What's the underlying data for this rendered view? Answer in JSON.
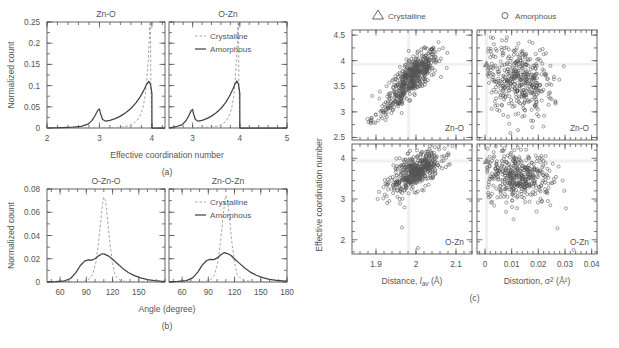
{
  "figure": {
    "panel_labels": {
      "a": "(a)",
      "b": "(b)",
      "c": "(c)"
    },
    "caption": ""
  },
  "panel_a": {
    "ylabel": "Normalized count",
    "xlabel": "Effective coordination number",
    "subplots": [
      {
        "title": "Zn-O",
        "xticks": [
          "2",
          "3",
          "4"
        ],
        "xlim": [
          2,
          4.25
        ]
      },
      {
        "title": "O-Zn",
        "xticks": [
          "3",
          "4",
          "5"
        ],
        "xlim": [
          2.5,
          5
        ]
      }
    ],
    "yticks": [
      "0",
      "0.05",
      "0.1",
      "0.15",
      "0.2",
      "0.25"
    ],
    "ylim": [
      0,
      0.25
    ],
    "legend": [
      {
        "label": "Crystalline",
        "style": "dashed",
        "color": "#9a9a9a"
      },
      {
        "label": "Amorphous",
        "style": "solid",
        "color": "#444444"
      }
    ]
  },
  "panel_b": {
    "ylabel": "Normalized count",
    "xlabel": "Angle (degree)",
    "subplots": [
      {
        "title": "O-Zn-O",
        "xticks": [
          "60",
          "90",
          "120",
          "150"
        ],
        "xlim": [
          45,
          180
        ]
      },
      {
        "title": "Zn-O-Zn",
        "xticks": [
          "60",
          "90",
          "120",
          "150",
          "180"
        ],
        "xlim": [
          45,
          180
        ]
      }
    ],
    "yticks": [
      "0",
      "0.02",
      "0.04",
      "0.06",
      "0.08"
    ],
    "ylim": [
      0,
      0.08
    ],
    "legend": [
      {
        "label": "Crystalline",
        "style": "dashed",
        "color": "#9a9a9a"
      },
      {
        "label": "Amorphous",
        "style": "solid",
        "color": "#444444"
      }
    ]
  },
  "panel_c": {
    "ylabel": "Effective coordination number",
    "legend": [
      {
        "label": "Crystalline",
        "marker": "triangle"
      },
      {
        "label": "Amorphous",
        "marker": "circle"
      }
    ],
    "columns": [
      {
        "xlabel_main": "Distance, ",
        "xlabel_var": "l",
        "xlabel_sub": "av",
        "xlabel_unit": " (Å)",
        "xticks": [
          "1.9",
          "2",
          "2.1"
        ],
        "xlim": [
          1.84,
          2.14
        ]
      },
      {
        "xlabel_main": "Distortion, ",
        "xlabel_var": "σ",
        "xlabel_sup": "2",
        "xlabel_unit": " (Å²)",
        "xticks": [
          "0",
          "0.01",
          "0.02",
          "0.03",
          "0.04"
        ],
        "xlim": [
          -0.003,
          0.042
        ]
      }
    ],
    "rows": [
      {
        "panel_tag": "Zn-O",
        "yticks": [
          "2.5",
          "3",
          "3.5",
          "4",
          "4.5"
        ],
        "ylim": [
          2.45,
          4.6
        ]
      },
      {
        "panel_tag": "O-Zn",
        "yticks": [
          "2",
          "3",
          "4"
        ],
        "ylim": [
          1.65,
          4.35
        ]
      }
    ]
  },
  "chart_data": [
    {
      "type": "line",
      "id": "a-left",
      "title": "Zn-O",
      "xlabel": "Effective coordination number",
      "ylabel": "Normalized count",
      "xlim": [
        2,
        4.25
      ],
      "ylim": [
        0,
        0.25
      ],
      "grid": false,
      "legend_position": "upper-right-shared",
      "series": [
        {
          "name": "Amorphous",
          "style": "solid",
          "x": [
            2.0,
            2.3,
            2.5,
            2.65,
            2.78,
            2.86,
            2.92,
            2.97,
            3.0,
            3.02,
            3.06,
            3.12,
            3.2,
            3.3,
            3.4,
            3.5,
            3.6,
            3.7,
            3.78,
            3.85,
            3.9,
            3.94,
            3.97,
            3.99,
            4.0,
            4.001,
            4.1,
            4.25
          ],
          "y": [
            0.0,
            0.001,
            0.002,
            0.004,
            0.009,
            0.018,
            0.03,
            0.042,
            0.045,
            0.034,
            0.02,
            0.016,
            0.018,
            0.022,
            0.028,
            0.036,
            0.046,
            0.06,
            0.074,
            0.09,
            0.103,
            0.11,
            0.104,
            0.09,
            0.082,
            0.0,
            0.0,
            0.0
          ]
        },
        {
          "name": "Crystalline",
          "style": "dashed",
          "x": [
            2.0,
            3.0,
            3.4,
            3.55,
            3.65,
            3.72,
            3.78,
            3.83,
            3.87,
            3.9,
            3.93,
            3.95,
            3.96,
            3.97,
            3.975,
            3.98,
            4.0,
            4.25
          ],
          "y": [
            0.0,
            0.0,
            0.002,
            0.005,
            0.01,
            0.018,
            0.03,
            0.048,
            0.074,
            0.11,
            0.16,
            0.21,
            0.25,
            0.25,
            0.2,
            0.11,
            0.0,
            0.0
          ]
        }
      ]
    },
    {
      "type": "line",
      "id": "a-right",
      "title": "O-Zn",
      "xlabel": "Effective coordination number",
      "ylabel": "Normalized count",
      "xlim": [
        2.5,
        5
      ],
      "ylim": [
        0,
        0.25
      ],
      "grid": false,
      "series": [
        {
          "name": "Amorphous",
          "style": "solid",
          "x": [
            2.5,
            2.65,
            2.78,
            2.86,
            2.92,
            2.97,
            3.0,
            3.02,
            3.06,
            3.12,
            3.2,
            3.3,
            3.4,
            3.5,
            3.6,
            3.7,
            3.78,
            3.85,
            3.9,
            3.94,
            3.97,
            3.99,
            4.0,
            4.001,
            4.3,
            5.0
          ],
          "y": [
            0.0,
            0.003,
            0.008,
            0.017,
            0.029,
            0.041,
            0.044,
            0.033,
            0.02,
            0.016,
            0.018,
            0.022,
            0.028,
            0.036,
            0.046,
            0.06,
            0.075,
            0.091,
            0.104,
            0.111,
            0.104,
            0.09,
            0.082,
            0.0,
            0.0,
            0.0
          ]
        },
        {
          "name": "Crystalline",
          "style": "dashed",
          "x": [
            2.5,
            3.0,
            3.4,
            3.55,
            3.65,
            3.72,
            3.78,
            3.83,
            3.87,
            3.9,
            3.93,
            3.95,
            3.96,
            3.97,
            3.975,
            3.98,
            4.0,
            5.0
          ],
          "y": [
            0.0,
            0.0,
            0.002,
            0.005,
            0.01,
            0.018,
            0.03,
            0.048,
            0.074,
            0.11,
            0.16,
            0.21,
            0.25,
            0.25,
            0.2,
            0.11,
            0.0,
            0.0
          ]
        }
      ]
    },
    {
      "type": "line",
      "id": "b-left",
      "title": "O-Zn-O",
      "xlabel": "Angle (degree)",
      "ylabel": "Normalized count",
      "xlim": [
        45,
        180
      ],
      "ylim": [
        0,
        0.08
      ],
      "grid": false,
      "series": [
        {
          "name": "Amorphous",
          "style": "solid",
          "x": [
            45,
            55,
            65,
            72,
            78,
            83,
            88,
            92,
            96,
            100,
            104,
            108,
            111,
            115,
            120,
            126,
            132,
            138,
            145,
            152,
            160,
            168,
            175,
            180
          ],
          "y": [
            0.0002,
            0.0004,
            0.001,
            0.003,
            0.008,
            0.014,
            0.018,
            0.019,
            0.0188,
            0.02,
            0.0225,
            0.0243,
            0.024,
            0.0225,
            0.0195,
            0.0155,
            0.0115,
            0.0082,
            0.0055,
            0.0035,
            0.002,
            0.0012,
            0.0008,
            0.0006
          ]
        },
        {
          "name": "Crystalline",
          "style": "dashed",
          "x": [
            45,
            85,
            92,
            97,
            101,
            104,
            107,
            109,
            110,
            112,
            114,
            117,
            120,
            123,
            126,
            130,
            140,
            180
          ],
          "y": [
            0.0,
            0.0002,
            0.0015,
            0.006,
            0.017,
            0.034,
            0.056,
            0.07,
            0.073,
            0.07,
            0.056,
            0.033,
            0.016,
            0.006,
            0.003,
            0.001,
            0.0002,
            0.0
          ]
        }
      ]
    },
    {
      "type": "line",
      "id": "b-right",
      "title": "Zn-O-Zn",
      "xlabel": "Angle (degree)",
      "ylabel": "Normalized count",
      "xlim": [
        45,
        180
      ],
      "ylim": [
        0,
        0.08
      ],
      "grid": false,
      "series": [
        {
          "name": "Amorphous",
          "style": "solid",
          "x": [
            45,
            55,
            65,
            72,
            78,
            83,
            88,
            92,
            96,
            100,
            104,
            108,
            112,
            116,
            120,
            126,
            132,
            138,
            145,
            152,
            160,
            168,
            175,
            180
          ],
          "y": [
            0.0002,
            0.0005,
            0.0012,
            0.0035,
            0.0085,
            0.0145,
            0.0185,
            0.0195,
            0.0192,
            0.0205,
            0.0232,
            0.0252,
            0.0245,
            0.0228,
            0.0198,
            0.0158,
            0.0118,
            0.0085,
            0.0058,
            0.0037,
            0.0022,
            0.0013,
            0.0009,
            0.0007
          ]
        },
        {
          "name": "Crystalline",
          "style": "dashed",
          "x": [
            45,
            85,
            92,
            97,
            101,
            104,
            107,
            109,
            110,
            112,
            114,
            117,
            120,
            123,
            127,
            132,
            142,
            180
          ],
          "y": [
            0.0,
            0.0002,
            0.0015,
            0.006,
            0.0175,
            0.035,
            0.057,
            0.071,
            0.0745,
            0.0705,
            0.0565,
            0.0335,
            0.0165,
            0.0065,
            0.0032,
            0.0012,
            0.0003,
            0.0
          ]
        }
      ]
    },
    {
      "type": "scatter",
      "id": "c-top-left",
      "panel_tag": "Zn-O",
      "xlabel": "Distance, l_av (Å)",
      "ylabel": "Effective coordination number",
      "xlim": [
        1.84,
        2.14
      ],
      "ylim": [
        2.45,
        4.6
      ],
      "series": [
        {
          "name": "Crystalline",
          "marker": "triangle",
          "x": [
            1.982
          ],
          "y": [
            3.93
          ]
        },
        {
          "name": "Amorphous",
          "marker": "circle",
          "n_points": 520,
          "cluster": {
            "x_center": 1.995,
            "y_center": 3.72,
            "x_spread": 0.03,
            "y_spread": 0.24,
            "correlation": 0.72
          },
          "tail": {
            "x_range": [
              1.885,
              1.965
            ],
            "y_range": [
              2.78,
              3.3
            ]
          }
        }
      ]
    },
    {
      "type": "scatter",
      "id": "c-top-right",
      "panel_tag": "Zn-O",
      "xlabel": "Distortion, σ² (Å²)",
      "ylabel": "Effective coordination number",
      "xlim": [
        -0.003,
        0.042
      ],
      "ylim": [
        2.45,
        4.6
      ],
      "series": [
        {
          "name": "Crystalline",
          "marker": "triangle",
          "x": [
            0.0006
          ],
          "y": [
            3.93
          ]
        },
        {
          "name": "Amorphous",
          "marker": "circle",
          "n_points": 430,
          "cluster": {
            "x_center": 0.0125,
            "y_center": 3.62,
            "x_spread": 0.0065,
            "y_spread": 0.34,
            "correlation": -0.15
          }
        }
      ]
    },
    {
      "type": "scatter",
      "id": "c-bottom-left",
      "panel_tag": "O-Zn",
      "xlabel": "Distance, l_av (Å)",
      "ylabel": "Effective coordination number",
      "xlim": [
        1.84,
        2.14
      ],
      "ylim": [
        1.65,
        4.35
      ],
      "series": [
        {
          "name": "Crystalline",
          "marker": "triangle",
          "x": [
            1.982
          ],
          "y": [
            3.93
          ]
        },
        {
          "name": "Amorphous",
          "marker": "circle",
          "n_points": 500,
          "cluster": {
            "x_center": 1.998,
            "y_center": 3.66,
            "x_spread": 0.032,
            "y_spread": 0.25,
            "correlation": 0.62
          },
          "outliers": [
            {
              "x": 1.965,
              "y": 2.3
            },
            {
              "x": 2.005,
              "y": 1.8
            }
          ]
        }
      ]
    },
    {
      "type": "scatter",
      "id": "c-bottom-right",
      "panel_tag": "O-Zn",
      "xlabel": "Distortion, σ² (Å²)",
      "ylabel": "Effective coordination number",
      "xlim": [
        -0.003,
        0.042
      ],
      "ylim": [
        1.65,
        4.35
      ],
      "series": [
        {
          "name": "Crystalline",
          "marker": "triangle",
          "x": [
            0.0006
          ],
          "y": [
            3.93
          ]
        },
        {
          "name": "Amorphous",
          "marker": "circle",
          "n_points": 430,
          "cluster": {
            "x_center": 0.0128,
            "y_center": 3.55,
            "x_spread": 0.0062,
            "y_spread": 0.32,
            "correlation": -0.1
          },
          "outliers": [
            {
              "x": 0.0272,
              "y": 2.28
            },
            {
              "x": 0.0332,
              "y": 1.75
            }
          ]
        }
      ]
    }
  ]
}
